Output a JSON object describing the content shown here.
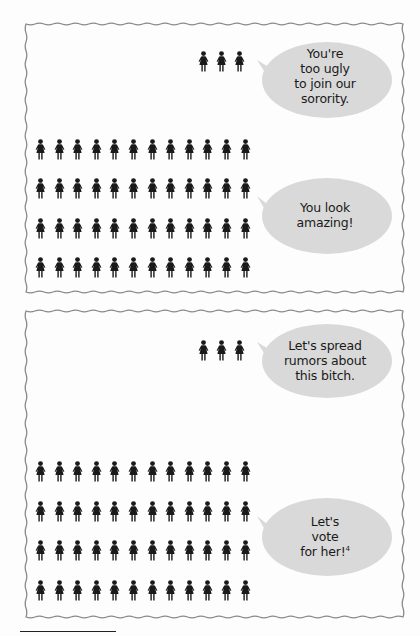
{
  "colors": {
    "figure": "#1a1a1a",
    "bubble_fill": "#d9d9d9",
    "frame_stroke": "#8a8a8a",
    "background": "#fdfdfd"
  },
  "icons": {
    "person": "woman-silhouette-icon"
  },
  "panels": [
    {
      "id": "top",
      "minority_group": {
        "count": 3,
        "bubble_lines": [
          "You're",
          "too ugly",
          "to join our",
          "sorority."
        ]
      },
      "majority_group": {
        "rows": 4,
        "per_row": 12,
        "count": 48,
        "bubble_lines": [
          "You look",
          "amazing!"
        ]
      }
    },
    {
      "id": "bottom",
      "minority_group": {
        "count": 3,
        "bubble_lines": [
          "Let's spread",
          "rumors about",
          "this bitch."
        ]
      },
      "majority_group": {
        "rows": 4,
        "per_row": 12,
        "count": 48,
        "bubble_lines": [
          "Let's",
          "vote",
          "for her!"
        ],
        "footnote_marker": "4"
      }
    }
  ]
}
